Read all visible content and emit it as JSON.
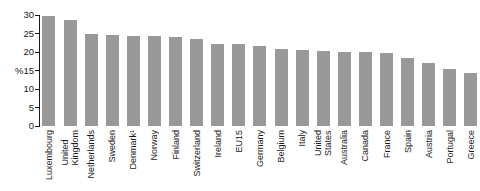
{
  "chart_data": {
    "type": "bar",
    "categories": [
      "Luxembourg",
      "United Kingdom",
      "Netherlands",
      "Sweden",
      "Denmark¹",
      "Norway",
      "Finland",
      "Switzerland",
      "Ireland",
      "EU15",
      "Germany",
      "Belgium",
      "Italy",
      "United States",
      "Australia",
      "Canada",
      "France",
      "Spain",
      "Austria",
      "Portugal",
      "Greece"
    ],
    "values": [
      29.9,
      28.8,
      24.9,
      24.8,
      24.5,
      24.4,
      24.1,
      23.6,
      22.3,
      22.2,
      21.7,
      20.9,
      20.6,
      20.4,
      20.2,
      20.2,
      19.9,
      18.4,
      17.2,
      15.4,
      14.5
    ],
    "title": "",
    "xlabel": "",
    "ylabel": "",
    "y_unit": "%",
    "y_unit_attached_to_tick": 15,
    "yticks": [
      0,
      5,
      10,
      15,
      20,
      25,
      30
    ],
    "ylim": [
      0,
      30
    ],
    "grid": false,
    "legend": null,
    "bar_color": "#999999",
    "axis_color": "#1a1a1a",
    "text_color": "#1a1a1a",
    "background": "#ffffff"
  }
}
